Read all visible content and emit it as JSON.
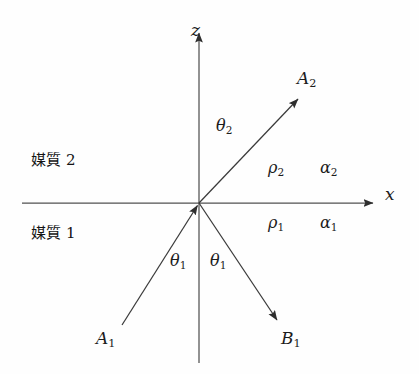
{
  "figure": {
    "kind": "wave-reflection-refraction-diagram",
    "background_color": "#fefefe",
    "stroke_color": "#3a3a3a",
    "text_color": "#1c1c1c"
  },
  "axes": {
    "origin": {
      "x": 199,
      "y": 203
    },
    "vertical": {
      "name": "z",
      "label": "z",
      "top": {
        "x": 199,
        "y": 27
      },
      "bottom": {
        "x": 199,
        "y": 363
      },
      "arrow_at": "top"
    },
    "horizontal": {
      "name": "x",
      "label": "x",
      "left": {
        "x": 22,
        "y": 203
      },
      "right": {
        "x": 379,
        "y": 203
      },
      "arrow_at": "right"
    }
  },
  "media": {
    "upper": {
      "label": "媒質 2",
      "text": "媒質",
      "number": "2"
    },
    "lower": {
      "label": "媒質 1",
      "text": "媒質",
      "number": "1"
    }
  },
  "parameters": {
    "upper": [
      {
        "symbol": "ρ",
        "sub": "2",
        "label": "ρ2"
      },
      {
        "symbol": "α",
        "sub": "2",
        "label": "α2"
      }
    ],
    "lower": [
      {
        "symbol": "ρ",
        "sub": "1",
        "label": "ρ1"
      },
      {
        "symbol": "α",
        "sub": "1",
        "label": "α1"
      }
    ]
  },
  "rays": [
    {
      "id": "incident",
      "symbol": "A",
      "sub": "1",
      "label": "A1",
      "from": {
        "x": 122,
        "y": 325
      },
      "to": {
        "x": 199,
        "y": 203
      },
      "arrow_at": "end",
      "description": "incident ray travelling up to the interface"
    },
    {
      "id": "reflected",
      "symbol": "B",
      "sub": "1",
      "label": "B1",
      "from": {
        "x": 199,
        "y": 203
      },
      "to": {
        "x": 279,
        "y": 323
      },
      "arrow_at": "end",
      "description": "reflected ray in medium 1"
    },
    {
      "id": "refracted",
      "symbol": "A",
      "sub": "2",
      "label": "A2",
      "from": {
        "x": 199,
        "y": 203
      },
      "to": {
        "x": 300,
        "y": 97
      },
      "arrow_at": "end",
      "description": "transmitted ray in medium 2"
    }
  ],
  "angles": [
    {
      "id": "theta2",
      "symbol": "θ",
      "sub": "2",
      "label": "θ2",
      "between": "z-axis and refracted ray"
    },
    {
      "id": "theta1-incident",
      "symbol": "θ",
      "sub": "1",
      "label": "θ1",
      "between": "negative z-axis and incident ray"
    },
    {
      "id": "theta1-reflected",
      "symbol": "θ",
      "sub": "1",
      "label": "θ1",
      "between": "negative z-axis and reflected ray"
    }
  ]
}
